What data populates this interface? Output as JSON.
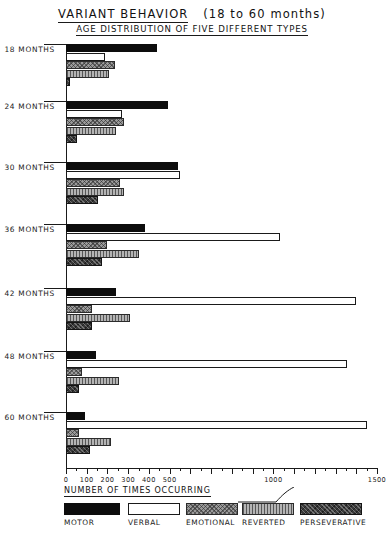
{
  "header": {
    "title": "VARIANT BEHAVIOR",
    "title_paren": "(18 to 60 months)",
    "subtitle": "AGE DISTRIBUTION OF FIVE DIFFERENT TYPES"
  },
  "chart_data": {
    "type": "bar",
    "orientation": "horizontal",
    "title": "VARIANT BEHAVIOR (18 to 60 months)",
    "subtitle": "AGE DISTRIBUTION OF FIVE DIFFERENT TYPES",
    "xlabel": "NUMBER OF TIMES OCCURRING",
    "ylabel": "",
    "xlim": [
      0,
      1500
    ],
    "grid": false,
    "legend_position": "bottom",
    "tick_major_step": 100,
    "tick_minor_step": 50,
    "xticks": [
      0,
      100,
      200,
      300,
      400,
      500,
      1000,
      1500
    ],
    "xtick_labels": [
      "0",
      "100",
      "200",
      "300",
      "400",
      "500",
      "1000",
      "1500"
    ],
    "categories": [
      "18 MONTHS",
      "24 MONTHS",
      "30 MONTHS",
      "36 MONTHS",
      "42 MONTHS",
      "48 MONTHS",
      "60 MONTHS"
    ],
    "series": [
      {
        "name": "MOTOR",
        "color": "#0d0d0d",
        "values": [
          440,
          490,
          540,
          380,
          240,
          145,
          90
        ]
      },
      {
        "name": "VERBAL",
        "color": "#ffffff",
        "values": [
          190,
          270,
          550,
          1030,
          1400,
          1355,
          1450
        ]
      },
      {
        "name": "EMOTIONAL",
        "color": "#9a9a9a",
        "values": [
          235,
          280,
          260,
          200,
          125,
          75,
          65
        ]
      },
      {
        "name": "REVERTED",
        "color": "#b4b4b4",
        "values": [
          205,
          240,
          280,
          350,
          310,
          255,
          215
        ]
      },
      {
        "name": "PERSEVERATIVE",
        "color": "#3a3a3a",
        "values": [
          20,
          55,
          155,
          175,
          125,
          65,
          115
        ]
      }
    ]
  },
  "legend": {
    "items": [
      {
        "label": "MOTOR",
        "swatch": "solid-black"
      },
      {
        "label": "VERBAL",
        "swatch": "outline-white"
      },
      {
        "label": "EMOTIONAL",
        "swatch": "cross-hatch-gray"
      },
      {
        "label": "REVERTED",
        "swatch": "vertical-stripe-gray"
      },
      {
        "label": "PERSEVERATIVE",
        "swatch": "mottled-dark"
      }
    ]
  }
}
